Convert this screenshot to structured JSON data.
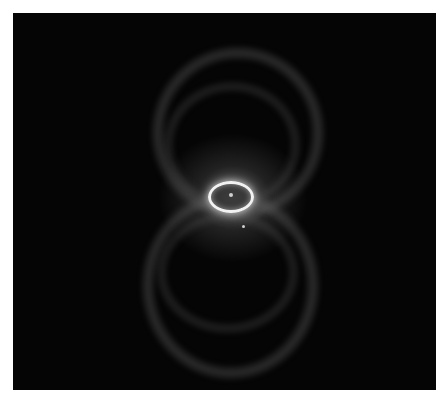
{
  "image": {
    "subject": "hourglass-shaped planetary nebula",
    "colors": {
      "background": "#050505",
      "frame": "#ffffff",
      "ring": "#f2f2f2",
      "lobes": "#6e6e6e"
    }
  }
}
